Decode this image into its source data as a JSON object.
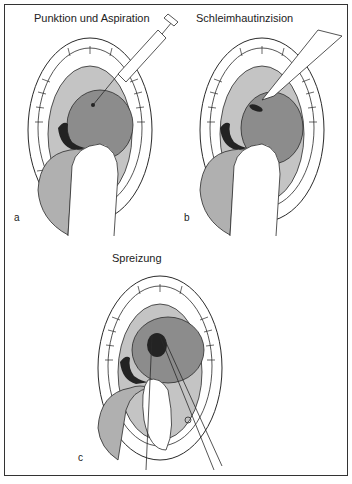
{
  "figure": {
    "panels": [
      {
        "id": "a",
        "label": "a",
        "title": "Punktion und  Aspiration",
        "instrument": "syringe-icon"
      },
      {
        "id": "b",
        "label": "b",
        "title": "Schleimhautinzision",
        "instrument": "scalpel-icon"
      },
      {
        "id": "c",
        "label": "c",
        "title": "Spreizung",
        "instrument": "forceps-icon"
      }
    ],
    "colors": {
      "palate": "#c4c4c4",
      "abscess": "#8c8c8c",
      "dark": "#232323",
      "tongue": "#b0b0b0",
      "outline": "#2a2a2a",
      "background": "#ffffff"
    }
  }
}
